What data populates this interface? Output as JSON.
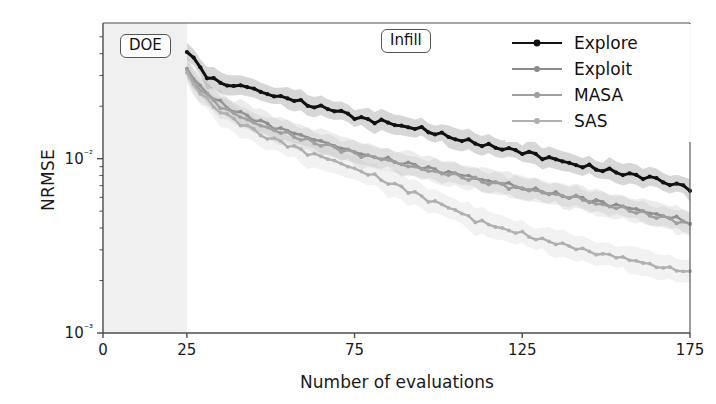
{
  "figure": {
    "background": "#ffffff",
    "axes_color": "#4d4d4d"
  },
  "annotations": [
    {
      "name": "doe-box",
      "label": "DOE",
      "x": 120,
      "y": 34
    },
    {
      "name": "infill-box",
      "label": "Infill",
      "x": 381,
      "y": 29
    }
  ],
  "legend": {
    "position": "upper right",
    "entries": [
      {
        "label": "Explore",
        "color": "#111111",
        "marker": "o"
      },
      {
        "label": "Exploit",
        "color": "#8c8c8c",
        "marker": "o"
      },
      {
        "label": "MASA",
        "color": "#9e9e9e",
        "marker": "o"
      },
      {
        "label": "SAS",
        "color": "#b0b0b0",
        "marker": "o"
      }
    ]
  },
  "chart_data": {
    "type": "line",
    "title": "",
    "xlabel": "Number of evaluations",
    "ylabel": "NRMSE",
    "xlim": [
      0,
      175
    ],
    "ylim": [
      0.001,
      0.06
    ],
    "yscale": "log",
    "xticks": [
      0,
      25,
      75,
      125,
      175
    ],
    "xticklabels": [
      "0",
      "25",
      "75",
      "125",
      "175"
    ],
    "yticks": [
      0.01,
      0.001
    ],
    "yticklabels": [
      "10⁻²",
      "10⁻³"
    ],
    "grid": false,
    "shaded_regions": [
      {
        "name": "doe-region",
        "x0": 0,
        "x1": 25,
        "color": "#f0f0f0",
        "label": "DOE"
      }
    ],
    "error_band": "shaded 1-sigma envelope around each series",
    "x": [
      25,
      27,
      29,
      31,
      33,
      35,
      37,
      39,
      41,
      43,
      45,
      47,
      49,
      51,
      53,
      55,
      57,
      59,
      61,
      63,
      65,
      67,
      69,
      71,
      73,
      75,
      77,
      79,
      81,
      83,
      85,
      87,
      89,
      91,
      93,
      95,
      97,
      99,
      101,
      103,
      105,
      107,
      109,
      111,
      113,
      115,
      117,
      119,
      121,
      123,
      125,
      127,
      129,
      131,
      133,
      135,
      137,
      139,
      141,
      143,
      145,
      147,
      149,
      151,
      153,
      155,
      157,
      159,
      161,
      163,
      165,
      167,
      169,
      171,
      173,
      175
    ],
    "series": [
      {
        "name": "Explore",
        "color": "#111111",
        "values": [
          0.042,
          0.0372,
          0.033,
          0.0298,
          0.0285,
          0.027,
          0.0262,
          0.0258,
          0.0262,
          0.0258,
          0.025,
          0.0241,
          0.0236,
          0.0231,
          0.0229,
          0.0224,
          0.0218,
          0.0211,
          0.0204,
          0.0201,
          0.0197,
          0.0196,
          0.0192,
          0.0184,
          0.0179,
          0.0174,
          0.017,
          0.0167,
          0.0165,
          0.0165,
          0.016,
          0.0156,
          0.0153,
          0.0151,
          0.0149,
          0.0146,
          0.0142,
          0.0139,
          0.0136,
          0.0134,
          0.0131,
          0.0129,
          0.0126,
          0.0124,
          0.0121,
          0.0119,
          0.0118,
          0.0116,
          0.0113,
          0.0111,
          0.011,
          0.0108,
          0.0106,
          0.0103,
          0.0101,
          0.0099,
          0.0097,
          0.0094,
          0.0092,
          0.009,
          0.0089,
          0.0087,
          0.0086,
          0.0085,
          0.0084,
          0.0082,
          0.008,
          0.0079,
          0.0078,
          0.0077,
          0.0076,
          0.0075,
          0.0073,
          0.0071,
          0.007,
          0.0068
        ],
        "band_frac": 0.14
      },
      {
        "name": "Exploit",
        "color": "#8c8c8c",
        "values": [
          0.033,
          0.029,
          0.0262,
          0.0239,
          0.0222,
          0.0209,
          0.0198,
          0.0189,
          0.0181,
          0.0174,
          0.0168,
          0.0162,
          0.0157,
          0.0152,
          0.0147,
          0.0143,
          0.0139,
          0.0135,
          0.0131,
          0.0128,
          0.0125,
          0.0122,
          0.0119,
          0.0116,
          0.0113,
          0.011,
          0.0108,
          0.0105,
          0.0103,
          0.0101,
          0.0099,
          0.0097,
          0.0095,
          0.0093,
          0.0091,
          0.009,
          0.0088,
          0.0086,
          0.0085,
          0.0083,
          0.0082,
          0.008,
          0.0079,
          0.0077,
          0.0076,
          0.0074,
          0.0073,
          0.0072,
          0.007,
          0.0069,
          0.0068,
          0.0067,
          0.0066,
          0.0065,
          0.0064,
          0.0063,
          0.0062,
          0.0061,
          0.006,
          0.0059,
          0.0058,
          0.0057,
          0.0056,
          0.0055,
          0.0054,
          0.0053,
          0.0052,
          0.0051,
          0.005,
          0.0049,
          0.0048,
          0.0047,
          0.0046,
          0.0045,
          0.0044,
          0.0043
        ],
        "band_frac": 0.16
      },
      {
        "name": "MASA",
        "color": "#9e9e9e",
        "values": [
          0.032,
          0.0282,
          0.0254,
          0.0232,
          0.0215,
          0.0202,
          0.0191,
          0.0182,
          0.0174,
          0.0167,
          0.0161,
          0.0156,
          0.0151,
          0.0146,
          0.0142,
          0.0138,
          0.0134,
          0.013,
          0.0127,
          0.0124,
          0.0121,
          0.0118,
          0.0115,
          0.0112,
          0.011,
          0.0107,
          0.0105,
          0.0103,
          0.0101,
          0.0099,
          0.0097,
          0.0095,
          0.0093,
          0.0091,
          0.009,
          0.0088,
          0.0086,
          0.0085,
          0.0083,
          0.0082,
          0.008,
          0.0079,
          0.0077,
          0.0076,
          0.0075,
          0.0073,
          0.0072,
          0.0071,
          0.0069,
          0.0068,
          0.0067,
          0.0066,
          0.0065,
          0.0064,
          0.0063,
          0.0062,
          0.0061,
          0.006,
          0.0059,
          0.0058,
          0.0057,
          0.0056,
          0.0055,
          0.0054,
          0.0053,
          0.0052,
          0.0051,
          0.005,
          0.0049,
          0.0048,
          0.0047,
          0.0046,
          0.0045,
          0.0044,
          0.0043,
          0.0042
        ],
        "band_frac": 0.16
      },
      {
        "name": "SAS",
        "color": "#b0b0b0",
        "values": [
          0.031,
          0.0268,
          0.0238,
          0.0216,
          0.0199,
          0.0186,
          0.0175,
          0.0166,
          0.0158,
          0.0151,
          0.0145,
          0.0139,
          0.0134,
          0.0129,
          0.0125,
          0.0121,
          0.0117,
          0.0113,
          0.0109,
          0.0106,
          0.0103,
          0.01,
          0.0097,
          0.0094,
          0.0091,
          0.0088,
          0.0085,
          0.0082,
          0.0079,
          0.0076,
          0.0073,
          0.007,
          0.0068,
          0.0065,
          0.0063,
          0.006,
          0.0058,
          0.0056,
          0.0054,
          0.0052,
          0.005,
          0.0048,
          0.0047,
          0.0045,
          0.0044,
          0.0042,
          0.0041,
          0.004,
          0.0039,
          0.0038,
          0.0037,
          0.0036,
          0.0035,
          0.0034,
          0.0034,
          0.0033,
          0.0032,
          0.0031,
          0.0031,
          0.003,
          0.0029,
          0.0029,
          0.0028,
          0.0028,
          0.0027,
          0.0027,
          0.0026,
          0.0026,
          0.0025,
          0.0025,
          0.0024,
          0.0024,
          0.0024,
          0.0023,
          0.0023,
          0.0022
        ],
        "band_frac": 0.18
      }
    ]
  }
}
